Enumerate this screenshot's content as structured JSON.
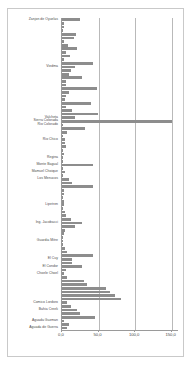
{
  "chart_data": {
    "type": "bar",
    "orientation": "horizontal",
    "title": "",
    "xlabel": "",
    "ylabel": "",
    "xlim": [
      0.0,
      160.0
    ],
    "xticks": [
      0.0,
      50.0,
      100.0,
      150.0
    ],
    "xtick_labels": [
      "0,0",
      "50,0",
      "100,0",
      "150,0"
    ],
    "grid": true,
    "grid_axis": "x",
    "legend": "none",
    "bar_color": "#8d8d8d",
    "labelled_categories": [
      "Zanjon de Oyuelas",
      "Viedma",
      "Valcheta",
      "Sierra Colorada",
      "Rio Colorado",
      "Rio Chico",
      "Regina",
      "Monte Bagual",
      "Mamuel Choique",
      "Los Menucos",
      "Lipetren",
      "Ing. Jacobacci",
      "Guardia Mitre",
      "El Cuy",
      "El Condor",
      "Choele Choel",
      "Comico Lordoro",
      "Bahia Creek",
      "Aguada Guzman",
      "Aguada de Guerra"
    ],
    "categories": [
      "Zanjon de Oyuelas",
      "",
      "",
      "",
      "",
      "",
      "",
      "",
      "",
      "",
      "",
      "",
      "",
      "Viedma",
      "",
      "",
      "",
      "",
      "",
      "",
      "",
      "",
      "",
      "",
      "",
      "",
      "",
      "Valcheta",
      "Sierra Colorada",
      "Rio Colorado",
      "",
      "",
      "",
      "Rio Chico",
      "",
      "",
      "",
      "",
      "Regina",
      "",
      "Monte Bagual",
      "",
      "Mamuel Choique",
      "",
      "Los Menucos",
      "",
      "",
      "",
      "",
      "",
      "",
      "Lipetren",
      "",
      "",
      "",
      "",
      "Ing. Jacobacci",
      "",
      "",
      "",
      "",
      "Guardia Mitre",
      "",
      "",
      "",
      "",
      "El Cuy",
      "",
      "El Condor",
      "",
      "Choele Choel",
      "",
      "",
      "",
      "",
      "",
      "",
      "",
      "Comico Lordoro",
      "",
      "Bahia Creek",
      "",
      "",
      "Aguada Guzman",
      "",
      "Aguada de Guerra"
    ],
    "values": [
      24.0,
      2.5,
      3.0,
      2.0,
      19.0,
      17.0,
      2.5,
      8.0,
      21.0,
      6.0,
      11.0,
      3.0,
      43.0,
      18.0,
      12.0,
      9.0,
      27.0,
      5.5,
      6.0,
      48.0,
      9.0,
      5.0,
      3.5,
      39.0,
      5.0,
      13.0,
      49.0,
      18.0,
      150.0,
      1.5,
      31.0,
      7.0,
      2.0,
      4.0,
      3.5,
      5.0,
      2.0,
      2.5,
      1.2,
      1.5,
      42.0,
      2.0,
      4.0,
      2.0,
      9.0,
      13.0,
      43.0,
      2.5,
      3.0,
      2.0,
      2.5,
      3.0,
      2.0,
      3.5,
      5.0,
      12.0,
      27.0,
      18.0,
      4.0,
      2.5,
      2.0,
      1.5,
      1.0,
      4.0,
      7.0,
      42.0,
      14.0,
      13.0,
      27.0,
      5.0,
      2.5,
      7.0,
      30.0,
      34.0,
      60.0,
      66.0,
      72.0,
      80.0,
      7.0,
      12.0,
      20.0,
      25.0,
      45.0,
      3.0,
      9.0,
      7.0
    ],
    "n_bars": 86,
    "note": "Horizontal bar chart of locality values; only a subset of category axis ticks are labelled."
  }
}
